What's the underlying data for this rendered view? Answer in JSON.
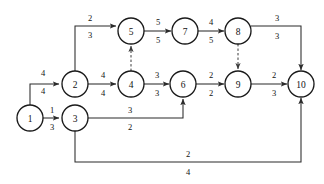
{
  "diagram": {
    "type": "activity-network-diagram",
    "width": 324,
    "height": 184,
    "background_color": "#ffffff",
    "line_color": "#2b2b2b",
    "node_radius": 13,
    "nodes": [
      {
        "id": "1",
        "label": "1",
        "cx": 30,
        "cy": 118
      },
      {
        "id": "2",
        "label": "2",
        "cx": 75,
        "cy": 84
      },
      {
        "id": "3",
        "label": "3",
        "cx": 75,
        "cy": 118
      },
      {
        "id": "4",
        "label": "4",
        "cx": 131,
        "cy": 84
      },
      {
        "id": "5",
        "label": "5",
        "cx": 131,
        "cy": 31
      },
      {
        "id": "6",
        "label": "6",
        "cx": 183,
        "cy": 84
      },
      {
        "id": "7",
        "label": "7",
        "cx": 185,
        "cy": 31
      },
      {
        "id": "8",
        "label": "8",
        "cx": 238,
        "cy": 31
      },
      {
        "id": "9",
        "label": "9",
        "cx": 238,
        "cy": 84
      },
      {
        "id": "10",
        "label": "10",
        "cx": 301,
        "cy": 84
      }
    ],
    "edges": [
      {
        "id": "e-1-2",
        "from": "1",
        "to": "2",
        "style": "solid",
        "upper_label": "4",
        "lower_label": "4",
        "label_x": 43,
        "upper_y": 73,
        "lower_y": 91,
        "path": "M 30 105 L 30 84 L 59 84"
      },
      {
        "id": "e-1-3",
        "from": "1",
        "to": "3",
        "style": "solid",
        "upper_label": "1",
        "lower_label": "3",
        "label_x": 52,
        "upper_y": 110,
        "lower_y": 127,
        "path": "M 43 118 L 59 118"
      },
      {
        "id": "e-2-5",
        "from": "2",
        "to": "5",
        "style": "solid",
        "upper_label": "2",
        "lower_label": "3",
        "label_x": 90,
        "upper_y": 18,
        "lower_y": 35,
        "path": "M 75 71 L 75 26 L 116 26"
      },
      {
        "id": "e-2-4",
        "from": "2",
        "to": "4",
        "style": "solid",
        "upper_label": "4",
        "lower_label": "4",
        "label_x": 103,
        "upper_y": 75,
        "lower_y": 93,
        "path": "M 88 84 L 116 84"
      },
      {
        "id": "e-4-5",
        "from": "4",
        "to": "5",
        "style": "dashed",
        "upper_label": "",
        "lower_label": "",
        "label_x": 131,
        "upper_y": 58,
        "lower_y": 58,
        "path": "M 131 71 L 131 46"
      },
      {
        "id": "e-5-7",
        "from": "5",
        "to": "7",
        "style": "solid",
        "upper_label": "5",
        "lower_label": "5",
        "label_x": 158,
        "upper_y": 22,
        "lower_y": 40,
        "path": "M 144 31 L 171 31"
      },
      {
        "id": "e-7-8",
        "from": "7",
        "to": "8",
        "style": "solid",
        "upper_label": "4",
        "lower_label": "5",
        "label_x": 211,
        "upper_y": 22,
        "lower_y": 40,
        "path": "M 197 31 L 224 31"
      },
      {
        "id": "e-4-6",
        "from": "4",
        "to": "6",
        "style": "solid",
        "upper_label": "3",
        "lower_label": "3",
        "label_x": 157,
        "upper_y": 75,
        "lower_y": 93,
        "path": "M 144 84 L 169 84"
      },
      {
        "id": "e-3-6",
        "from": "3",
        "to": "6",
        "style": "solid",
        "upper_label": "3",
        "lower_label": "2",
        "label_x": 130,
        "upper_y": 110,
        "lower_y": 127,
        "path": "M 88 118 L 183 118 L 183 99"
      },
      {
        "id": "e-6-9",
        "from": "6",
        "to": "9",
        "style": "solid",
        "upper_label": "2",
        "lower_label": "2",
        "label_x": 211,
        "upper_y": 75,
        "lower_y": 93,
        "path": "M 196 84 L 224 84"
      },
      {
        "id": "e-8-9",
        "from": "8",
        "to": "9",
        "style": "dashed",
        "upper_label": "",
        "lower_label": "",
        "label_x": 238,
        "upper_y": 58,
        "lower_y": 58,
        "path": "M 238 44 L 238 69"
      },
      {
        "id": "e-8-10",
        "from": "8",
        "to": "10",
        "style": "solid",
        "upper_label": "3",
        "lower_label": "3",
        "label_x": 277,
        "upper_y": 18,
        "lower_y": 36,
        "path": "M 251 26 L 301 26 L 301 70"
      },
      {
        "id": "e-9-10",
        "from": "9",
        "to": "10",
        "style": "solid",
        "upper_label": "2",
        "lower_label": "3",
        "label_x": 274,
        "upper_y": 75,
        "lower_y": 93,
        "path": "M 251 84 L 287 84"
      },
      {
        "id": "e-3-10",
        "from": "3",
        "to": "10",
        "style": "solid",
        "upper_label": "2",
        "lower_label": "4",
        "label_x": 188,
        "upper_y": 154,
        "lower_y": 172,
        "path": "M 75 131 L 75 162 L 301 162 L 301 98"
      }
    ]
  }
}
